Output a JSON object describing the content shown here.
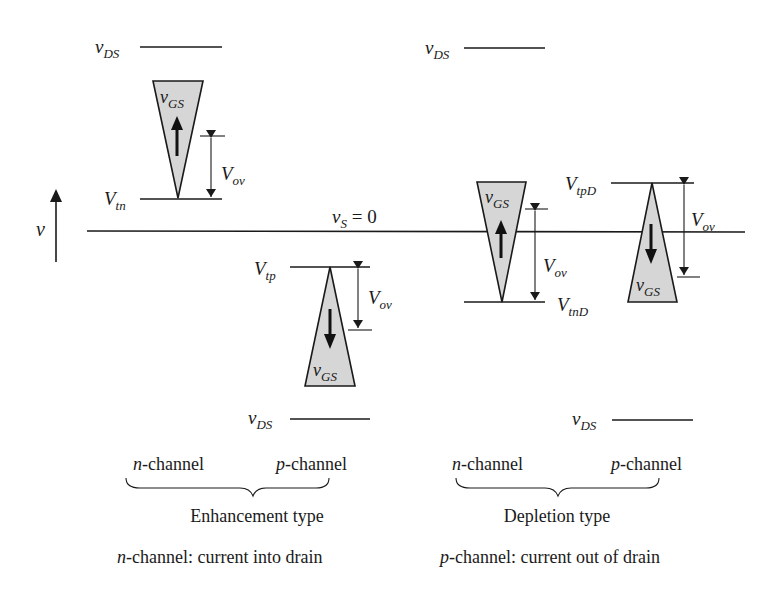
{
  "diagram": {
    "axis": {
      "label": "v",
      "reference_label": "v",
      "reference_sub": "S",
      "reference_eq": " = 0"
    },
    "enhancement": {
      "n_channel": {
        "vds_label": "v",
        "vds_sub": "DS",
        "vgs_label": "v",
        "vgs_sub": "GS",
        "vt_label": "V",
        "vt_sub": "tn",
        "vov_label": "V",
        "vov_sub": "ov",
        "arrow_direction": "up"
      },
      "p_channel": {
        "vds_label": "v",
        "vds_sub": "DS",
        "vgs_label": "v",
        "vgs_sub": "GS",
        "vt_label": "V",
        "vt_sub": "tp",
        "vov_label": "V",
        "vov_sub": "ov",
        "arrow_direction": "down"
      }
    },
    "depletion": {
      "n_channel": {
        "vds_label": "v",
        "vds_sub": "DS",
        "vgs_label": "v",
        "vgs_sub": "GS",
        "vt_label": "V",
        "vt_sub": "tnD",
        "vov_label": "V",
        "vov_sub": "ov",
        "arrow_direction": "up"
      },
      "p_channel": {
        "vds_label": "v",
        "vds_sub": "DS",
        "vgs_label": "v",
        "vgs_sub": "GS",
        "vt_label": "V",
        "vt_sub": "tpD",
        "vov_label": "V",
        "vov_sub": "ov",
        "arrow_direction": "down"
      }
    },
    "labels": {
      "n_prefix": "n",
      "p_prefix": "p",
      "channel_suffix": "-channel",
      "enhancement_type": "Enhancement type",
      "depletion_type": "Depletion type",
      "caption_n_rest": "-channel: current into drain",
      "caption_p_rest": "-channel: current out of drain"
    },
    "colors": {
      "stroke": "#1a1a1a",
      "triangle_fill": "#d6d6d6",
      "background": "#ffffff"
    }
  }
}
